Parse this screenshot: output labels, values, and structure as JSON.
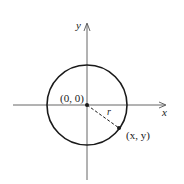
{
  "diagram": {
    "labels": {
      "origin": "(0, 0)",
      "x_axis": "x",
      "y_axis": "y",
      "radius": "r",
      "point": "(x, y)"
    },
    "geometry": {
      "origin_px": [
        87,
        105
      ],
      "radius_px": 40,
      "point_px": [
        119,
        128
      ]
    },
    "colors": {
      "stroke": "#1a1a1a",
      "axis": "#555555",
      "background": "#ffffff"
    }
  }
}
